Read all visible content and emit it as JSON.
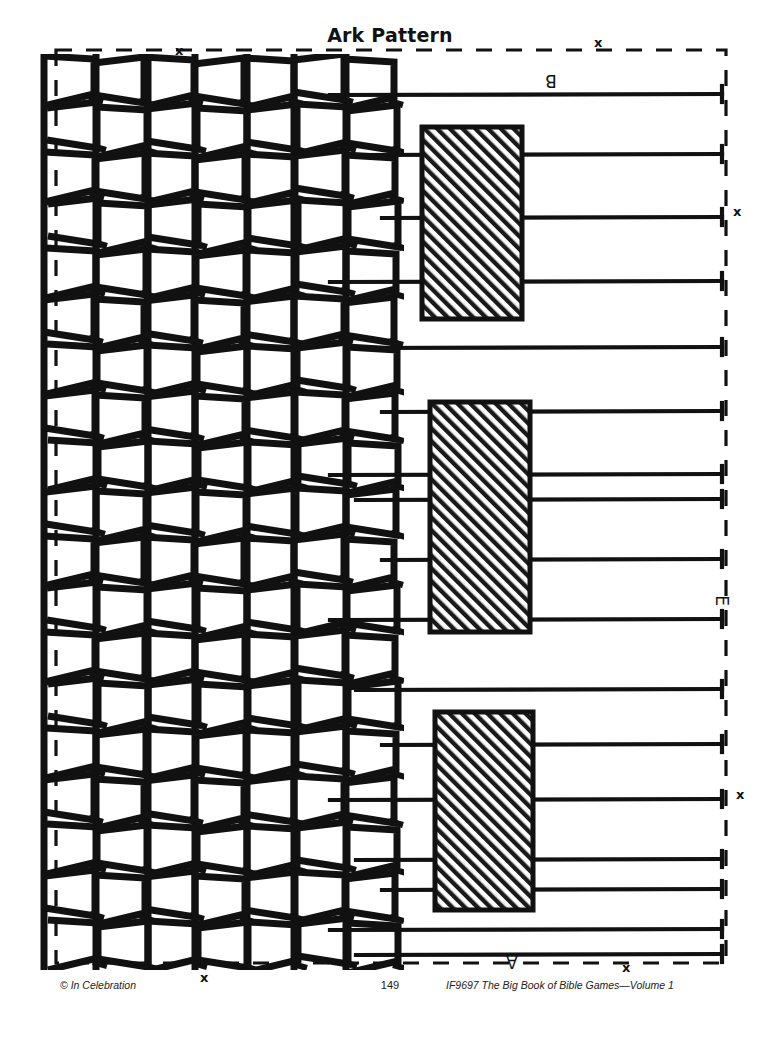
{
  "page": {
    "title": "Ark Pattern",
    "width": 780,
    "height": 1047,
    "background": "#ffffff",
    "ink_color": "#111111"
  },
  "footer": {
    "copyright": "© In Celebration",
    "page_number": "149",
    "source": "IF9697 The Big Book of Bible Games—Volume 1"
  },
  "labels": [
    {
      "name": "label-b",
      "text": "B",
      "x": 545,
      "y": 72,
      "rotation": 180
    },
    {
      "name": "label-e",
      "text": "E",
      "x": 716,
      "y": 592,
      "rotation": 90
    },
    {
      "name": "label-a",
      "text": "A",
      "x": 506,
      "y": 953,
      "rotation": 180
    }
  ],
  "x_markers": [
    {
      "name": "x-marker-top-left",
      "text": "x",
      "x": 175,
      "y": 44
    },
    {
      "name": "x-marker-top-right",
      "text": "x",
      "x": 594,
      "y": 36
    },
    {
      "name": "x-marker-right-upper",
      "text": "x",
      "x": 733,
      "y": 205
    },
    {
      "name": "x-marker-right-lower",
      "text": "x",
      "x": 736,
      "y": 788
    },
    {
      "name": "x-marker-bottom-left",
      "text": "x",
      "x": 200,
      "y": 971
    },
    {
      "name": "x-marker-bottom-right",
      "text": "x",
      "x": 622,
      "y": 961
    }
  ],
  "artwork": {
    "border": {
      "name": "dashed-cut-border",
      "left": 56,
      "top": 50,
      "right": 726,
      "bottom": 963,
      "style": "dashed",
      "stroke": "#111111",
      "stroke_width": 3.2,
      "dash": "16 14"
    },
    "weave": {
      "name": "woven-basket-pattern",
      "left": 46,
      "top": 58,
      "columns": 7,
      "column_width": 50,
      "rows": 19,
      "row_height": 48,
      "stroke": "#111111",
      "stroke_width": 7
    },
    "strips": {
      "name": "horizontal-strips",
      "count": 19,
      "stroke": "#111111",
      "stroke_width": 4.2,
      "right_edge": 722,
      "y_positions": [
        95,
        155,
        218,
        282,
        348,
        412,
        475,
        500,
        560,
        620,
        690,
        745,
        800,
        860,
        890,
        930,
        955
      ]
    },
    "hatched_rects": [
      {
        "name": "hatched-panel-top",
        "x": 422,
        "y": 127,
        "w": 100,
        "h": 192
      },
      {
        "name": "hatched-panel-middle",
        "x": 430,
        "y": 402,
        "w": 100,
        "h": 230
      },
      {
        "name": "hatched-panel-bottom",
        "x": 435,
        "y": 712,
        "w": 98,
        "h": 198
      }
    ]
  }
}
